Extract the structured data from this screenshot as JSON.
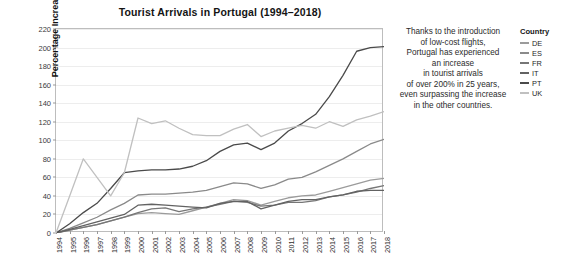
{
  "chart_data": {
    "type": "line",
    "title": "Tourist Arrivals in Portugal (1994–2018)",
    "xlabel": "",
    "ylabel": "Percentage Increase Since 1994",
    "ylim": [
      0,
      220
    ],
    "ytick_step": 20,
    "yticks": [
      0,
      20,
      40,
      60,
      80,
      100,
      120,
      140,
      160,
      180,
      200,
      220
    ],
    "grid": true,
    "grid_axis": "y",
    "legend_position": "right",
    "legend_title": "Country",
    "x": [
      1994,
      1995,
      1996,
      1997,
      1998,
      1999,
      2000,
      2001,
      2002,
      2003,
      2004,
      2005,
      2006,
      2007,
      2008,
      2009,
      2010,
      2011,
      2012,
      2013,
      2014,
      2015,
      2016,
      2017,
      2018
    ],
    "categories": [
      "1994",
      "1995",
      "1996",
      "1997",
      "1998",
      "1999",
      "2000",
      "2001",
      "2002",
      "2003",
      "2004",
      "2005",
      "2006",
      "2007",
      "2008",
      "2009",
      "2010",
      "2011",
      "2012",
      "2013",
      "2014",
      "2015",
      "2016",
      "2017",
      "2018"
    ],
    "series": [
      {
        "name": "DE",
        "color": "#9b9b9b",
        "values": [
          0,
          3,
          6,
          9,
          13,
          17,
          21,
          22,
          21,
          20,
          24,
          28,
          32,
          36,
          35,
          30,
          34,
          38,
          40,
          41,
          45,
          49,
          53,
          57,
          59
        ]
      },
      {
        "name": "ES",
        "color": "#8a8a8a",
        "values": [
          0,
          5,
          11,
          17,
          25,
          32,
          41,
          42,
          42,
          43,
          44,
          46,
          50,
          54,
          53,
          48,
          52,
          58,
          60,
          66,
          73,
          80,
          88,
          96,
          101
        ]
      },
      {
        "name": "FR",
        "color": "#767676",
        "values": [
          0,
          3,
          6,
          9,
          13,
          17,
          22,
          26,
          27,
          23,
          26,
          28,
          31,
          34,
          33,
          29,
          30,
          33,
          33,
          35,
          39,
          41,
          44,
          48,
          51
        ]
      },
      {
        "name": "IT",
        "color": "#626262",
        "values": [
          0,
          4,
          8,
          12,
          16,
          20,
          30,
          31,
          30,
          29,
          28,
          27,
          32,
          34,
          34,
          26,
          30,
          34,
          36,
          36,
          39,
          41,
          45,
          46,
          46
        ]
      },
      {
        "name": "PT",
        "color": "#4a4a4a",
        "values": [
          0,
          10,
          22,
          32,
          48,
          65,
          67,
          68,
          68,
          69,
          72,
          78,
          88,
          95,
          97,
          90,
          97,
          110,
          118,
          128,
          147,
          170,
          196,
          200,
          201
        ]
      },
      {
        "name": "UK",
        "color": "#c0c0c0",
        "values": [
          0,
          40,
          80,
          60,
          40,
          65,
          124,
          118,
          121,
          113,
          106,
          105,
          105,
          112,
          117,
          104,
          110,
          113,
          116,
          113,
          120,
          115,
          122,
          126,
          131
        ]
      }
    ],
    "annotation": {
      "lines": [
        "Thanks to the introduction",
        "of low-cost flights,",
        "Portugal has experienced",
        "an increase",
        "in tourist arrivals",
        "of over 200% in 25 years,",
        "even surpassing the increase",
        "in the other countries."
      ]
    }
  }
}
